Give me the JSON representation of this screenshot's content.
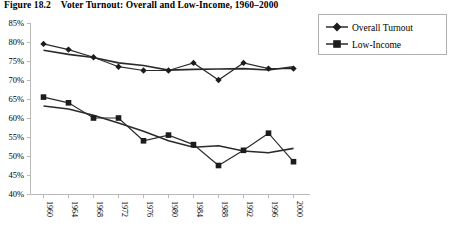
{
  "title": {
    "figure_number": "Figure 18.2",
    "text": "Voter Turnout: Overall and Low-Income, 1960–2000",
    "full": "Figure 18.2    Voter Turnout: Overall and Low-Income, 1960–2000"
  },
  "legend": {
    "position": "top-right",
    "entries": [
      {
        "label": "Overall Turnout",
        "marker": "diamond",
        "color": "#1c1c1c"
      },
      {
        "label": "Low-Income",
        "marker": "square",
        "color": "#1c1c1c"
      }
    ]
  },
  "chart_data": {
    "type": "line",
    "title": "Voter Turnout: Overall and Low-Income, 1960–2000",
    "xlabel": "",
    "ylabel": "",
    "x": [
      1960,
      1964,
      1968,
      1972,
      1976,
      1980,
      1984,
      1988,
      1992,
      1996,
      2000
    ],
    "categories": [
      "1960",
      "1964",
      "1968",
      "1972",
      "1976",
      "1980",
      "1984",
      "1988",
      "1992",
      "1996",
      "2000"
    ],
    "series": [
      {
        "name": "Overall Turnout",
        "marker": "diamond",
        "values": [
          79.5,
          78.0,
          76.0,
          73.5,
          72.5,
          72.5,
          74.5,
          70.0,
          74.5,
          73.0,
          73.0
        ]
      },
      {
        "name": "Low-Income",
        "marker": "square",
        "values": [
          65.5,
          64.0,
          60.0,
          60.0,
          54.0,
          55.5,
          53.0,
          47.5,
          51.5,
          56.0,
          48.5
        ]
      }
    ],
    "trend_lines": true,
    "ylim": [
      40,
      85
    ],
    "ytick_step": 5,
    "ytick_labels": [
      "40%",
      "45%",
      "50%",
      "55%",
      "60%",
      "65%",
      "70%",
      "75%",
      "80%",
      "85%"
    ],
    "ytick_values": [
      40,
      45,
      50,
      55,
      60,
      65,
      70,
      75,
      80,
      85
    ],
    "grid": false,
    "legend_position": "top-right",
    "units": "percent"
  },
  "axes": {
    "y_labels": [
      "85%",
      "80%",
      "75%",
      "70%",
      "65%",
      "60%",
      "55%",
      "50%",
      "45%",
      "40%"
    ],
    "x_labels": [
      "1960",
      "1964",
      "1968",
      "1972",
      "1976",
      "1980",
      "1984",
      "1988",
      "1992",
      "1996",
      "2000"
    ]
  }
}
